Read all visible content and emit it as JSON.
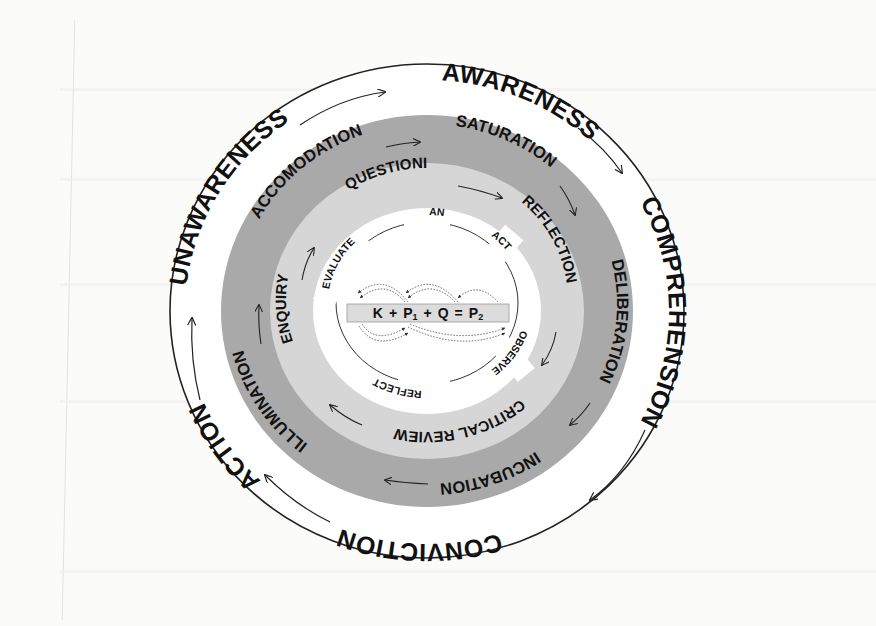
{
  "diagram": {
    "colors": {
      "background": "#fbfbfa",
      "outer_ring": "#ffffff",
      "dark_ring": "#a9a9a9",
      "light_ring": "#d6d6d6",
      "inner_disc": "#ffffff",
      "stroke": "#222222",
      "equation_box": "#dcdcdc"
    },
    "outer_ring": {
      "labels": [
        "AWARENESS",
        "COMPREHENSION",
        "CONVICTION",
        "ACTION",
        "UNAWARENESS"
      ]
    },
    "dark_ring": {
      "labels": [
        "SATURATION",
        "DELIBERATION",
        "INCUBATION",
        "ILLUMINATION",
        "ACCOMODATION"
      ]
    },
    "light_ring": {
      "labels": [
        "QUESTIONING",
        "REFLECTION",
        "CRITICAL REVIEW",
        "ENQUIRY"
      ]
    },
    "inner_cycle": {
      "labels": [
        "PLAN",
        "ACT",
        "OBSERVE",
        "REFLECT",
        "EVALUATE"
      ]
    },
    "equation": {
      "terms": [
        "K",
        "+",
        "P",
        "1",
        "+",
        "Q",
        "=",
        "P",
        "2"
      ],
      "text": "K + P1 + Q = P2"
    }
  }
}
